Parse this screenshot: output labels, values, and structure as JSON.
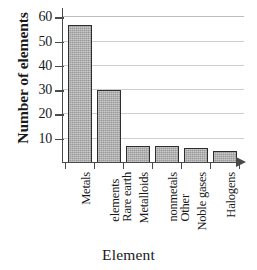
{
  "chart_data": {
    "type": "bar",
    "title": "",
    "xlabel": "Element",
    "ylabel": "Number of elements",
    "categories": [
      "Metals",
      "Rare earth elements",
      "Metalloids",
      "Other nonmetals",
      "Noble gases",
      "Halogens"
    ],
    "category_lines": [
      [
        "Metals"
      ],
      [
        "Rare earth",
        "elements"
      ],
      [
        "Metalloids"
      ],
      [
        "Other",
        "nonmetals"
      ],
      [
        "Noble gases"
      ],
      [
        "Halogens"
      ]
    ],
    "values": [
      57,
      30,
      7,
      7,
      6,
      5
    ],
    "ylim": [
      0,
      63
    ],
    "yticks": [
      10,
      20,
      30,
      40,
      50,
      60
    ],
    "ytick_labels": [
      "10",
      "20",
      "30",
      "40",
      "50",
      "60"
    ],
    "grid": true,
    "grid_axis": "y",
    "legend": null,
    "bar_fill": "#a9a9a9",
    "bar_edge": "#2e2e2e",
    "axis_color": "#4a4a4a",
    "grid_color": "#bdbdbd",
    "background": "#ffffff"
  },
  "axes": {
    "x_axis_arrow": "arrow-right-icon",
    "y_title": "Number of elements",
    "x_title": "Element"
  }
}
